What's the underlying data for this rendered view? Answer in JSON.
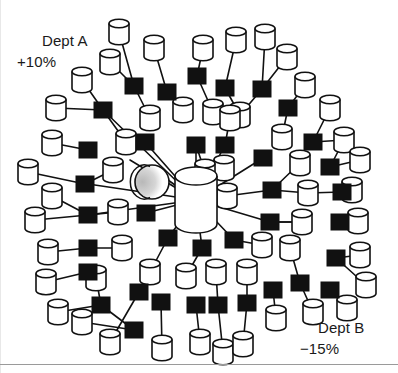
{
  "diagram": {
    "type": "node-link-network",
    "background_color": "#ffffff",
    "stroke_color": "#111111",
    "node_fill_cylinder": "#ffffff",
    "node_fill_square": "#111111",
    "sphere_shade_color": "#c9c9c9",
    "rule_color": "#9a9a9a"
  },
  "annotations": {
    "dept_a": {
      "name": "Dept A",
      "delta": "+10%"
    },
    "dept_b": {
      "name": "Dept B",
      "delta": "−15%"
    }
  },
  "legend_semantics": {
    "cylinder": "database-node",
    "square": "switch-node",
    "hub": "central-database-hub",
    "sphere": "globe-node"
  },
  "hub": {
    "cx": 196,
    "cy": 200,
    "rx": 21,
    "ry": 9,
    "height": 48
  },
  "sphere": {
    "cx": 152,
    "cy": 182,
    "r": 17
  },
  "cylinders": [
    {
      "x": 119,
      "y": 32
    },
    {
      "x": 154,
      "y": 48
    },
    {
      "x": 203,
      "y": 48
    },
    {
      "x": 236,
      "y": 40
    },
    {
      "x": 265,
      "y": 37
    },
    {
      "x": 110,
      "y": 62
    },
    {
      "x": 287,
      "y": 57
    },
    {
      "x": 82,
      "y": 80
    },
    {
      "x": 56,
      "y": 108
    },
    {
      "x": 305,
      "y": 85
    },
    {
      "x": 150,
      "y": 118
    },
    {
      "x": 183,
      "y": 110
    },
    {
      "x": 213,
      "y": 112
    },
    {
      "x": 240,
      "y": 115
    },
    {
      "x": 330,
      "y": 108
    },
    {
      "x": 126,
      "y": 142
    },
    {
      "x": 52,
      "y": 143
    },
    {
      "x": 282,
      "y": 137
    },
    {
      "x": 344,
      "y": 140
    },
    {
      "x": 360,
      "y": 160
    },
    {
      "x": 28,
      "y": 172
    },
    {
      "x": 113,
      "y": 170
    },
    {
      "x": 224,
      "y": 168
    },
    {
      "x": 300,
      "y": 163
    },
    {
      "x": 352,
      "y": 190
    },
    {
      "x": 52,
      "y": 196
    },
    {
      "x": 227,
      "y": 196
    },
    {
      "x": 308,
      "y": 193
    },
    {
      "x": 118,
      "y": 212
    },
    {
      "x": 35,
      "y": 220
    },
    {
      "x": 302,
      "y": 222
    },
    {
      "x": 358,
      "y": 221
    },
    {
      "x": 122,
      "y": 248
    },
    {
      "x": 48,
      "y": 252
    },
    {
      "x": 262,
      "y": 245
    },
    {
      "x": 290,
      "y": 248
    },
    {
      "x": 360,
      "y": 255
    },
    {
      "x": 46,
      "y": 282
    },
    {
      "x": 150,
      "y": 272
    },
    {
      "x": 96,
      "y": 278
    },
    {
      "x": 186,
      "y": 276
    },
    {
      "x": 216,
      "y": 272
    },
    {
      "x": 247,
      "y": 272
    },
    {
      "x": 366,
      "y": 285
    },
    {
      "x": 58,
      "y": 312
    },
    {
      "x": 82,
      "y": 322
    },
    {
      "x": 110,
      "y": 342
    },
    {
      "x": 162,
      "y": 348
    },
    {
      "x": 200,
      "y": 342
    },
    {
      "x": 223,
      "y": 352
    },
    {
      "x": 243,
      "y": 344
    },
    {
      "x": 276,
      "y": 318
    },
    {
      "x": 313,
      "y": 312
    },
    {
      "x": 347,
      "y": 308
    },
    {
      "x": 205,
      "y": 172
    },
    {
      "x": 230,
      "y": 118
    }
  ],
  "squares": [
    {
      "x": 134,
      "y": 86
    },
    {
      "x": 167,
      "y": 92
    },
    {
      "x": 197,
      "y": 76
    },
    {
      "x": 225,
      "y": 88
    },
    {
      "x": 262,
      "y": 89
    },
    {
      "x": 103,
      "y": 110
    },
    {
      "x": 288,
      "y": 108
    },
    {
      "x": 145,
      "y": 142
    },
    {
      "x": 196,
      "y": 145
    },
    {
      "x": 225,
      "y": 145
    },
    {
      "x": 88,
      "y": 150
    },
    {
      "x": 263,
      "y": 158
    },
    {
      "x": 313,
      "y": 142
    },
    {
      "x": 330,
      "y": 167
    },
    {
      "x": 85,
      "y": 184
    },
    {
      "x": 272,
      "y": 190
    },
    {
      "x": 342,
      "y": 192
    },
    {
      "x": 88,
      "y": 215
    },
    {
      "x": 146,
      "y": 213
    },
    {
      "x": 270,
      "y": 222
    },
    {
      "x": 340,
      "y": 222
    },
    {
      "x": 88,
      "y": 248
    },
    {
      "x": 168,
      "y": 238
    },
    {
      "x": 202,
      "y": 248
    },
    {
      "x": 234,
      "y": 240
    },
    {
      "x": 336,
      "y": 258
    },
    {
      "x": 88,
      "y": 272
    },
    {
      "x": 300,
      "y": 283
    },
    {
      "x": 139,
      "y": 292
    },
    {
      "x": 101,
      "y": 305
    },
    {
      "x": 161,
      "y": 302
    },
    {
      "x": 196,
      "y": 305
    },
    {
      "x": 218,
      "y": 305
    },
    {
      "x": 247,
      "y": 303
    },
    {
      "x": 273,
      "y": 290
    },
    {
      "x": 330,
      "y": 290
    },
    {
      "x": 134,
      "y": 330
    }
  ],
  "spokes_from_hub": [
    {
      "x": 103,
      "y": 110
    },
    {
      "x": 145,
      "y": 142
    },
    {
      "x": 196,
      "y": 145
    },
    {
      "x": 225,
      "y": 145
    },
    {
      "x": 88,
      "y": 184
    },
    {
      "x": 146,
      "y": 213
    },
    {
      "x": 88,
      "y": 215
    },
    {
      "x": 202,
      "y": 248
    },
    {
      "x": 168,
      "y": 238
    },
    {
      "x": 234,
      "y": 240
    },
    {
      "x": 263,
      "y": 158
    },
    {
      "x": 272,
      "y": 190
    },
    {
      "x": 270,
      "y": 222
    },
    {
      "x": 168,
      "y": 180
    },
    {
      "x": 130,
      "y": 160
    }
  ],
  "links": [
    [
      119,
      32,
      134,
      86
    ],
    [
      110,
      62,
      134,
      86
    ],
    [
      154,
      48,
      167,
      92
    ],
    [
      203,
      48,
      197,
      76
    ],
    [
      236,
      40,
      225,
      88
    ],
    [
      265,
      37,
      262,
      89
    ],
    [
      287,
      57,
      262,
      89
    ],
    [
      82,
      80,
      103,
      110
    ],
    [
      56,
      108,
      103,
      110
    ],
    [
      305,
      85,
      288,
      108
    ],
    [
      134,
      86,
      150,
      118
    ],
    [
      167,
      92,
      183,
      110
    ],
    [
      197,
      76,
      213,
      112
    ],
    [
      225,
      88,
      240,
      115
    ],
    [
      262,
      89,
      240,
      115
    ],
    [
      288,
      108,
      282,
      137
    ],
    [
      330,
      108,
      313,
      142
    ],
    [
      103,
      110,
      126,
      142
    ],
    [
      52,
      143,
      88,
      150
    ],
    [
      344,
      140,
      330,
      167
    ],
    [
      360,
      160,
      330,
      167
    ],
    [
      313,
      142,
      344,
      140
    ],
    [
      28,
      172,
      85,
      184
    ],
    [
      113,
      170,
      85,
      184
    ],
    [
      300,
      163,
      272,
      190
    ],
    [
      352,
      190,
      342,
      192
    ],
    [
      308,
      193,
      342,
      192
    ],
    [
      272,
      190,
      308,
      193
    ],
    [
      52,
      196,
      88,
      215
    ],
    [
      118,
      212,
      88,
      215
    ],
    [
      35,
      220,
      88,
      215
    ],
    [
      302,
      222,
      270,
      222
    ],
    [
      358,
      221,
      340,
      222
    ],
    [
      270,
      222,
      302,
      222
    ],
    [
      122,
      248,
      88,
      248
    ],
    [
      48,
      252,
      88,
      248
    ],
    [
      262,
      245,
      234,
      240
    ],
    [
      290,
      248,
      300,
      283
    ],
    [
      360,
      255,
      336,
      258
    ],
    [
      46,
      282,
      88,
      272
    ],
    [
      96,
      278,
      101,
      305
    ],
    [
      150,
      272,
      168,
      238
    ],
    [
      186,
      276,
      202,
      248
    ],
    [
      216,
      272,
      218,
      305
    ],
    [
      247,
      272,
      247,
      303
    ],
    [
      366,
      285,
      336,
      258
    ],
    [
      58,
      312,
      101,
      305
    ],
    [
      82,
      322,
      134,
      330
    ],
    [
      110,
      342,
      139,
      292
    ],
    [
      162,
      348,
      161,
      302
    ],
    [
      200,
      342,
      196,
      305
    ],
    [
      223,
      352,
      218,
      305
    ],
    [
      243,
      344,
      247,
      303
    ],
    [
      276,
      318,
      273,
      290
    ],
    [
      313,
      312,
      300,
      283
    ],
    [
      347,
      308,
      330,
      290
    ],
    [
      205,
      172,
      196,
      145
    ],
    [
      230,
      118,
      225,
      145
    ],
    [
      139,
      292,
      150,
      272
    ],
    [
      134,
      330,
      101,
      305
    ]
  ]
}
